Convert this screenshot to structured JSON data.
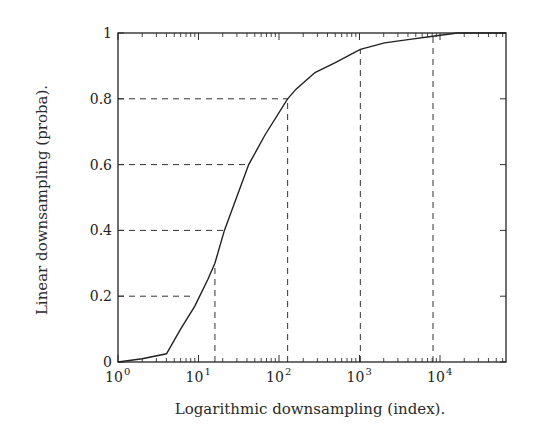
{
  "chart_data": {
    "type": "line",
    "title": "",
    "xlabel": "Logarithmic downsampling (index).",
    "ylabel": "Linear downsampling (proba).",
    "xscale": "log",
    "xlim": [
      1,
      65536
    ],
    "ylim": [
      0,
      1
    ],
    "xticks": [
      {
        "value": 1,
        "base": "10",
        "exp": "0"
      },
      {
        "value": 10,
        "base": "10",
        "exp": "1"
      },
      {
        "value": 100,
        "base": "10",
        "exp": "2"
      },
      {
        "value": 1000,
        "base": "10",
        "exp": "3"
      },
      {
        "value": 10000,
        "base": "10",
        "exp": "4"
      }
    ],
    "yticks": [
      {
        "value": 0,
        "label": "0"
      },
      {
        "value": 0.2,
        "label": "0.2"
      },
      {
        "value": 0.4,
        "label": "0.4"
      },
      {
        "value": 0.6,
        "label": "0.6"
      },
      {
        "value": 0.8,
        "label": "0.8"
      },
      {
        "value": 1,
        "label": "1"
      }
    ],
    "grid": false,
    "legend": null,
    "series": [
      {
        "name": "mapping",
        "x": [
          1,
          2,
          4,
          6,
          9,
          13,
          16,
          21,
          42,
          67,
          128,
          164,
          280,
          500,
          1024,
          2048,
          4000,
          8192,
          16384,
          65536
        ],
        "y": [
          0.0,
          0.01,
          0.025,
          0.1,
          0.17,
          0.25,
          0.3,
          0.4,
          0.6,
          0.69,
          0.8,
          0.83,
          0.88,
          0.91,
          0.95,
          0.97,
          0.98,
          0.99,
          1.0,
          1.0
        ]
      }
    ],
    "guides": {
      "horizontal": [
        {
          "y": 0.2,
          "x_end": 9
        },
        {
          "y": 0.4,
          "x_end": 21
        },
        {
          "y": 0.6,
          "x_end": 42
        },
        {
          "y": 0.8,
          "x_end": 128
        }
      ],
      "vertical": [
        {
          "x": 16,
          "y_end": 0.3
        },
        {
          "x": 128,
          "y_end": 0.8
        },
        {
          "x": 1024,
          "y_end": 0.95
        },
        {
          "x": 8192,
          "y_end": 0.99
        }
      ]
    }
  },
  "labels": {
    "xlabel": "Logarithmic downsampling (index).",
    "ylabel": "Linear downsampling (proba)."
  }
}
